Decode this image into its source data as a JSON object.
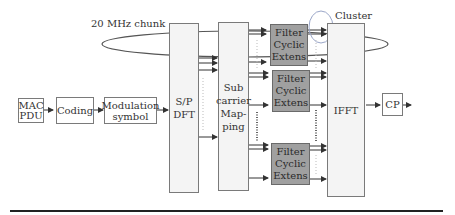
{
  "diagram": {
    "labels": {
      "chunk": "20 MHz chunk",
      "cluster": "Cluster"
    },
    "blocks": {
      "mac_pdu": [
        "MAC",
        "PDU"
      ],
      "coding": "Coding",
      "modulation": [
        "Modulation",
        "symbol"
      ],
      "sp_dft": [
        "S/P",
        "DFT"
      ],
      "subcarrier_mapping": [
        "Sub",
        "carrier",
        "Map-",
        "ping"
      ],
      "filters": [
        [
          "Filter",
          "Cyclic",
          "Extens"
        ],
        [
          "Filter",
          "Cyclic",
          "Extens"
        ],
        [
          "Filter",
          "Cyclic",
          "Extens"
        ]
      ],
      "ifft": "IFFT",
      "cp": "CP"
    },
    "colors": {
      "filter_fill": "#a0a0a0",
      "tall_block_fill": "#f4f4f4",
      "line": "#333333",
      "cluster_circle": "#9aa6c8"
    }
  }
}
